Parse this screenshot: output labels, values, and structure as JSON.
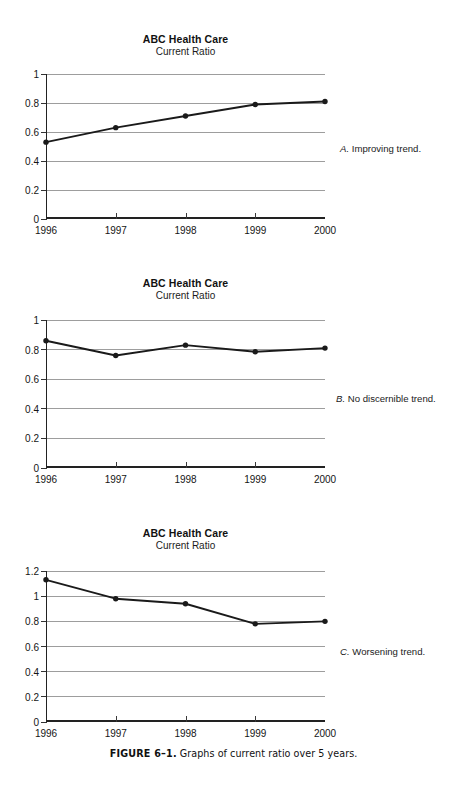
{
  "page": {
    "background_color": "#ffffff",
    "ink_color": "#1a1a1a",
    "gridline_color": "#9d9d9d"
  },
  "figure_caption": {
    "number": "FIGURE 6–1.",
    "text": "Graphs of current ratio over 5 years."
  },
  "charts": [
    {
      "id": "chart-a",
      "title": "ABC Health Care",
      "subtitle": "Current Ratio",
      "side_caption_letter": "A.",
      "side_caption_text": "Improving trend.",
      "ytick_labels": [
        "1",
        "0.8",
        "0.6",
        "0.4",
        "0.2",
        "0"
      ],
      "xtick_labels": [
        "1996",
        "1997",
        "1998",
        "1999",
        "2000"
      ]
    },
    {
      "id": "chart-b",
      "title": "ABC Health Care",
      "subtitle": "Current Ratio",
      "side_caption_letter": "B.",
      "side_caption_text": "No discernible trend.",
      "ytick_labels": [
        "1",
        "0.8",
        "0.6",
        "0.4",
        "0.2",
        "0"
      ],
      "xtick_labels": [
        "1996",
        "1997",
        "1998",
        "1999",
        "2000"
      ]
    },
    {
      "id": "chart-c",
      "title": "ABC Health Care",
      "subtitle": "Current Ratio",
      "side_caption_letter": "C.",
      "side_caption_text": "Worsening trend.",
      "ytick_labels": [
        "1.2",
        "1",
        "0.8",
        "0.6",
        "0.4",
        "0.2",
        "0"
      ],
      "xtick_labels": [
        "1996",
        "1997",
        "1998",
        "1999",
        "2000"
      ]
    }
  ],
  "chart_data": [
    {
      "type": "line",
      "title": "ABC Health Care",
      "subtitle": "Current Ratio",
      "annotation": "A. Improving trend.",
      "xlabel": "",
      "ylabel": "",
      "categories": [
        "1996",
        "1997",
        "1998",
        "1999",
        "2000"
      ],
      "values": [
        0.53,
        0.63,
        0.71,
        0.79,
        0.81
      ],
      "yticks": [
        0,
        0.2,
        0.4,
        0.6,
        0.8,
        1
      ],
      "ylim": [
        0,
        1
      ],
      "grid": "horizontal",
      "legend": "none",
      "markers": "filled-circle",
      "line_color": "#1a1a1a"
    },
    {
      "type": "line",
      "title": "ABC Health Care",
      "subtitle": "Current Ratio",
      "annotation": "B. No discernible trend.",
      "xlabel": "",
      "ylabel": "",
      "categories": [
        "1996",
        "1997",
        "1998",
        "1999",
        "2000"
      ],
      "values": [
        0.86,
        0.76,
        0.83,
        0.785,
        0.81
      ],
      "yticks": [
        0,
        0.2,
        0.4,
        0.6,
        0.8,
        1
      ],
      "ylim": [
        0,
        1
      ],
      "grid": "horizontal",
      "legend": "none",
      "markers": "filled-circle",
      "line_color": "#1a1a1a"
    },
    {
      "type": "line",
      "title": "ABC Health Care",
      "subtitle": "Current Ratio",
      "annotation": "C. Worsening trend.",
      "xlabel": "",
      "ylabel": "",
      "categories": [
        "1996",
        "1997",
        "1998",
        "1999",
        "2000"
      ],
      "values": [
        1.13,
        0.98,
        0.94,
        0.78,
        0.8
      ],
      "yticks": [
        0,
        0.2,
        0.4,
        0.6,
        0.8,
        1,
        1.2
      ],
      "ylim": [
        0,
        1.2
      ],
      "grid": "horizontal",
      "legend": "none",
      "markers": "filled-circle",
      "line_color": "#1a1a1a"
    }
  ]
}
